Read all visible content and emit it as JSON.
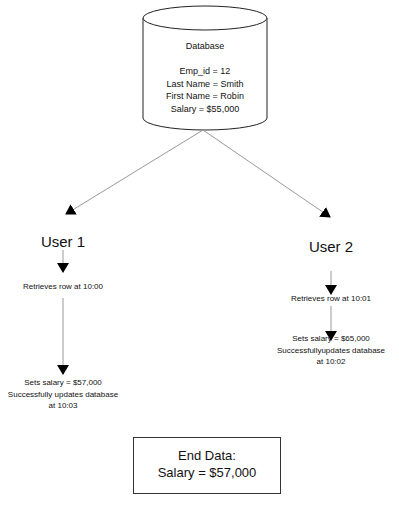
{
  "database": {
    "title": "Database",
    "fields": [
      "Emp_id = 12",
      "Last Name = Smith",
      "First Name = Robin",
      "Salary = $55,000"
    ]
  },
  "user1": {
    "label": "User 1",
    "step1": "Retrieves row at 10:00",
    "step2": [
      "Sets salary = $57,000",
      "Successfully updates database",
      "at 10:03"
    ]
  },
  "user2": {
    "label": "User 2",
    "step1": "Retrieves row at 10:01",
    "step2": [
      "Sets salary = $65,000",
      "Successfullyupdates database",
      "at 10:02"
    ]
  },
  "end_data": {
    "title": "End Data:",
    "value": "Salary = $57,000"
  }
}
